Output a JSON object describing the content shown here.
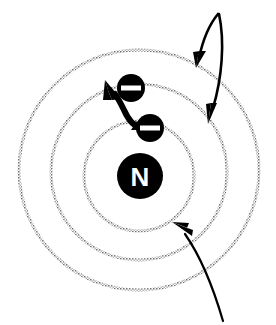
{
  "figure": {
    "background_color": "#ffffff",
    "width": 276,
    "height": 325
  },
  "nucleus": {
    "label": "N",
    "name": "nucleus",
    "fill_color": "#000000",
    "text_color": "#ffffff",
    "center_x": 140,
    "center_y": 176,
    "radius": 23
  },
  "orbits": [
    {
      "name": "inner-orbit",
      "label": "",
      "center_x": 139,
      "center_y": 176,
      "radius": 55,
      "stroke_color": "#8a8a8a",
      "style": "dotted"
    },
    {
      "name": "middle-orbit",
      "label": "",
      "center_x": 139,
      "center_y": 172,
      "radius": 88,
      "stroke_color": "#8a8a8a",
      "style": "dotted"
    },
    {
      "name": "outer-orbit",
      "label": "",
      "center_x": 139,
      "center_y": 170,
      "radius": 120,
      "stroke_color": "#8a8a8a",
      "style": "dotted"
    }
  ],
  "electrons": [
    {
      "name": "electron-outer",
      "symbol": "–",
      "center_x": 131,
      "center_y": 88,
      "radius": 14,
      "fill_color": "#000000",
      "sign_color": "#ffffff"
    },
    {
      "name": "electron-inner",
      "symbol": "–",
      "center_x": 150,
      "center_y": 128,
      "radius": 14,
      "fill_color": "#000000",
      "sign_color": "#ffffff"
    }
  ],
  "transition_arrow": {
    "name": "electron-jump-arrow",
    "label": "",
    "color": "#000000",
    "from_x": 140,
    "from_y": 126,
    "to_x": 111,
    "to_y": 92
  },
  "leader_lines": [
    {
      "name": "leader-line-outer-orbit",
      "label": "",
      "color": "#000000",
      "start_x": 218,
      "start_y": 14,
      "end_x": 200,
      "end_y": 64
    },
    {
      "name": "leader-line-middle-orbit",
      "label": "",
      "color": "#000000",
      "start_x": 219,
      "start_y": 14,
      "end_x": 209,
      "end_y": 120
    },
    {
      "name": "leader-line-inner-orbit",
      "label": "",
      "color": "#000000",
      "start_x": 223,
      "start_y": 321,
      "end_x": 175,
      "end_y": 224
    }
  ]
}
